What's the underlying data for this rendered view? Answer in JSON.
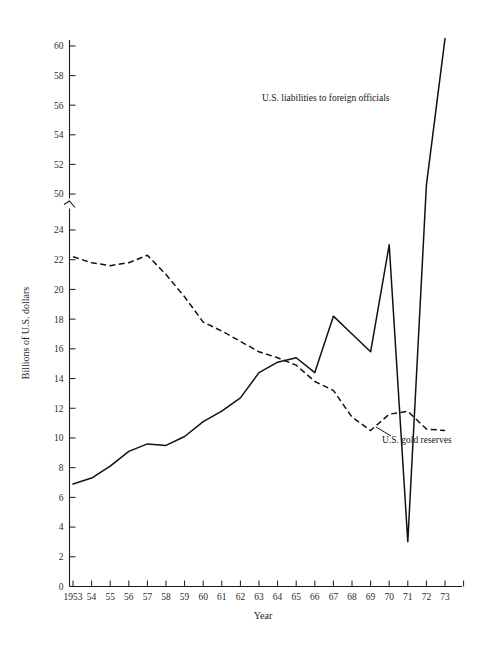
{
  "chart_data": {
    "type": "line",
    "title": "",
    "xlabel": "Year",
    "ylabel": "Billions of U.S. dollars",
    "x": [
      1953,
      1954,
      1955,
      1956,
      1957,
      1958,
      1959,
      1960,
      1961,
      1962,
      1963,
      1964,
      1965,
      1966,
      1967,
      1968,
      1969,
      1970,
      1971,
      1972,
      1973
    ],
    "xtick_labels": [
      "1953",
      "54",
      "55",
      "56",
      "57",
      "58",
      "59",
      "60",
      "61",
      "62",
      "63",
      "64",
      "65",
      "66",
      "67",
      "68",
      "69",
      "70",
      "71",
      "72",
      "73"
    ],
    "ytick_labels_lower": [
      "0",
      "2",
      "4",
      "6",
      "8",
      "10",
      "12",
      "14",
      "16",
      "18",
      "20",
      "22",
      "24"
    ],
    "ytick_labels_upper": [
      "50",
      "52",
      "54",
      "56",
      "58",
      "60"
    ],
    "ylim_lower": [
      0,
      24
    ],
    "ylim_upper": [
      50,
      61
    ],
    "axis_break": true,
    "axis_break_note": "y-axis broken between 24 and 50",
    "grid": false,
    "legend_position": "inline-annotation",
    "series": [
      {
        "name": "U.S. liabilities to foreign officials",
        "style": "solid",
        "values": [
          6.9,
          7.3,
          8.1,
          9.1,
          9.6,
          9.5,
          10.1,
          11.1,
          11.8,
          12.7,
          14.4,
          15.1,
          15.4,
          14.4,
          18.2,
          17.0,
          15.8,
          23.0,
          26.5,
          50.6,
          60.5
        ]
      },
      {
        "name": "U.S. gold reserves",
        "style": "dashed",
        "values": [
          22.2,
          21.8,
          21.6,
          21.8,
          22.3,
          21.0,
          19.5,
          17.8,
          17.2,
          16.5,
          15.8,
          15.4,
          14.9,
          13.8,
          13.2,
          11.4,
          10.5,
          11.6,
          11.8,
          10.6,
          10.5
        ]
      }
    ],
    "annotations": [
      {
        "text": "U.S. liabilities to foreign officials",
        "x_pixel": 262,
        "y_pixel": 101
      },
      {
        "text": "U.S. gold reserves",
        "x_pixel": 382,
        "y_pixel": 440
      }
    ]
  },
  "figure": {
    "background_color": "#ffffff",
    "line_color": "#111111",
    "text_color": "#1a1a1a",
    "width": 487,
    "height": 646
  }
}
